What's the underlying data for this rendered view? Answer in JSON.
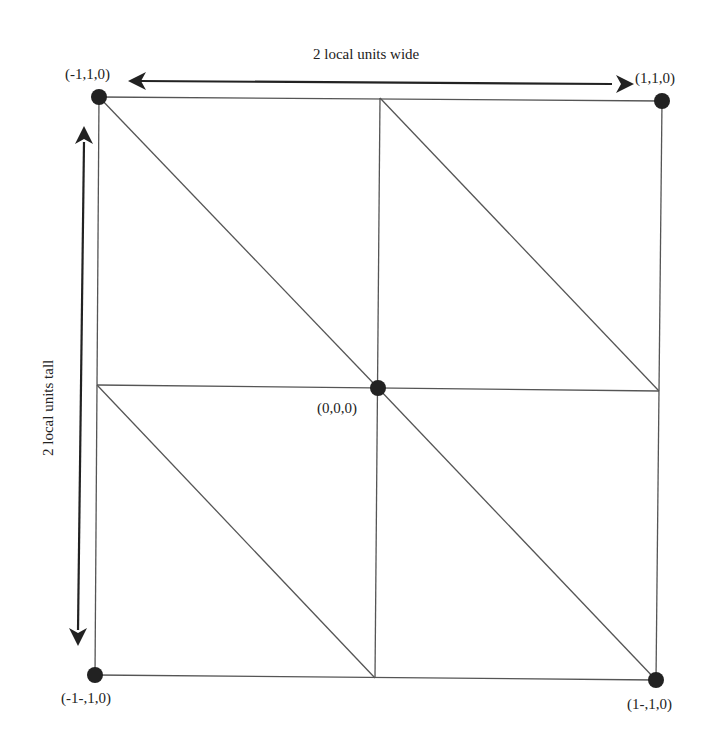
{
  "diagram": {
    "dimension_labels": {
      "width": "2 local units wide",
      "height": "2 local units tall"
    },
    "vertices": [
      {
        "id": "top-left",
        "label": "(-1,1,0)"
      },
      {
        "id": "top-right",
        "label": "(1,1,0)"
      },
      {
        "id": "center",
        "label": "(0,0,0)"
      },
      {
        "id": "bottom-left",
        "label": "(-1-,1,0)"
      },
      {
        "id": "bottom-right",
        "label": "(1-,1,0)"
      }
    ],
    "grid": {
      "rows": 2,
      "cols": 2,
      "triangles_per_cell": 2,
      "diagonal_direction": "top-left to bottom-right"
    },
    "colors": {
      "line": "#555555",
      "vertex": "#222222",
      "text": "#222222",
      "background": "#ffffff"
    }
  }
}
